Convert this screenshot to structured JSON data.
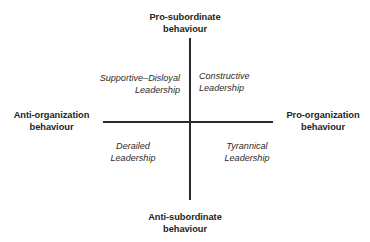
{
  "diagram": {
    "type": "two-by-two-quadrant-matrix",
    "background_color": "#ffffff",
    "axis_color": "#2b2b2b",
    "text_color": "#231f20",
    "axes": {
      "vertical": {
        "name": "subordinate-behaviour-axis",
        "top_pole": {
          "line1": "Pro-subordinate",
          "line2": "behaviour"
        },
        "bottom_pole": {
          "line1": "Anti-subordinate",
          "line2": "behaviour"
        }
      },
      "horizontal": {
        "name": "organization-behaviour-axis",
        "left_pole": {
          "line1": "Anti-organization",
          "line2": "behaviour"
        },
        "right_pole": {
          "line1": "Pro-organization",
          "line2": "behaviour"
        }
      }
    },
    "quadrants": [
      {
        "position": "top-left",
        "line1": "Supportive–Disloyal",
        "line2": "Leadership"
      },
      {
        "position": "top-right",
        "line1": "Constructive",
        "line2": "Leadership"
      },
      {
        "position": "bottom-left",
        "line1": "Derailed",
        "line2": "Leadership"
      },
      {
        "position": "bottom-right",
        "line1": "Tyrannical",
        "line2": "Leadership"
      }
    ]
  }
}
